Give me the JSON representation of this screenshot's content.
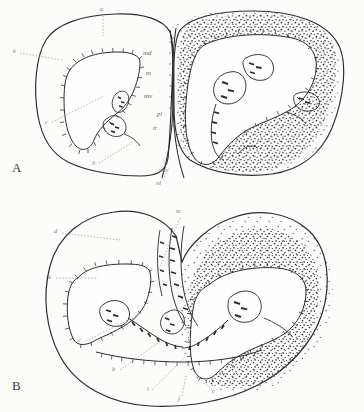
{
  "figure": {
    "kind": "histological-cross-section-plate",
    "background_color": "#fdfdfc",
    "ink_color": "#2b2b2b",
    "label_color": "#5c5c5c",
    "panel_count": 2
  },
  "panels": [
    {
      "id": "A",
      "letter": "A",
      "labels": [
        {
          "key": "a",
          "text": "a",
          "x": 100,
          "y": 8,
          "leader": "vertical-dotted-down"
        },
        {
          "key": "k",
          "text": "k",
          "x": 13,
          "y": 51,
          "leader": "horizontal-dotted-right"
        },
        {
          "key": "md",
          "text": "md",
          "x": 143,
          "y": 53,
          "leader": "none"
        },
        {
          "key": "m",
          "text": "m",
          "x": 145,
          "y": 73,
          "leader": "none"
        },
        {
          "key": "mv",
          "text": "mv",
          "x": 144,
          "y": 96,
          "leader": "none"
        },
        {
          "key": "c",
          "text": "c",
          "x": 45,
          "y": 122,
          "leader": "diagonal-dotted-up-right"
        },
        {
          "key": "pl",
          "text": "pl",
          "x": 156,
          "y": 114,
          "leader": "none"
        },
        {
          "key": "tr",
          "text": "tr",
          "x": 152,
          "y": 128,
          "leader": "none"
        },
        {
          "key": "b",
          "text": "b",
          "x": 92,
          "y": 163,
          "leader": "diagonal-dotted-up-right"
        },
        {
          "key": "um",
          "text": "um",
          "x": 161,
          "y": 170,
          "leader": "short-dotted-up"
        },
        {
          "key": "nl",
          "text": "nl",
          "x": 157,
          "y": 182,
          "leader": "short-dotted-up"
        }
      ]
    },
    {
      "id": "B",
      "letter": "B",
      "labels": [
        {
          "key": "m",
          "text": "m",
          "x": 175,
          "y": 210,
          "leader": "diagonal-dotted-down-left"
        },
        {
          "key": "d",
          "text": "d",
          "x": 54,
          "y": 231,
          "leader": "horizontal-dotted-right"
        },
        {
          "key": "k",
          "text": "k",
          "x": 48,
          "y": 276,
          "leader": "horizontal-dotted-right"
        },
        {
          "key": "c",
          "text": "c",
          "x": 78,
          "y": 339,
          "leader": "diagonal-dotted-up-right"
        },
        {
          "key": "b",
          "text": "b",
          "x": 112,
          "y": 368,
          "leader": "diagonal-dotted-up-right"
        },
        {
          "key": "l",
          "text": "l",
          "x": 146,
          "y": 388,
          "leader": "diagonal-dotted-up-right"
        },
        {
          "key": "f",
          "text": "f",
          "x": 177,
          "y": 398,
          "leader": "vertical-dotted-up"
        },
        {
          "key": "e",
          "text": "e",
          "x": 212,
          "y": 392,
          "leader": "diagonal-dotted-up-left"
        }
      ]
    }
  ]
}
